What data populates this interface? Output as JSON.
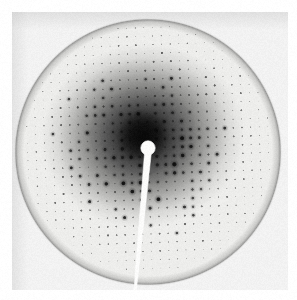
{
  "image": {
    "title": "X-ray diffraction pattern",
    "subject": "single-crystal still diffraction photograph",
    "width": 297,
    "height": 300,
    "background_color": "#ffffff"
  },
  "film": {
    "label": "detector-film-plate",
    "x": 12,
    "y": 12,
    "width": 276,
    "height": 278,
    "base_color": "#f2f2f2",
    "edge_shadow_color": "#e3e3e3",
    "grain_opacity": 0.05
  },
  "diffraction_disc": {
    "label": "diffraction-disc",
    "center_x": 148,
    "center_y": 152,
    "radius": 131,
    "interior_color": "#ededeb",
    "edge_ring_color": "#9a9a98",
    "edge_ring_width": 2.2
  },
  "central_halo": {
    "label": "direct-beam-halo",
    "center_x": 143,
    "center_y": 136,
    "inner_radius": 6,
    "outer_radius": 96,
    "core_color": "#0d0d0d",
    "mid_color": "#6b6b6b",
    "falloff_exponent": 1.55
  },
  "beamstop": {
    "label": "beamstop-shadow",
    "disc_center_x": 148,
    "disc_center_y": 148,
    "disc_radius": 7.2,
    "color": "#fbfbfa",
    "arm_top_x": 148,
    "arm_top_y": 152,
    "arm_top_half_width": 3.4,
    "arm_bottom_x": 135,
    "arm_bottom_y": 292,
    "arm_bottom_half_width": 1.1
  },
  "lattice": {
    "label": "reciprocal-lattice-spots",
    "spacing_x": 8.6,
    "spacing_y": 8.6,
    "rotation_degrees": -2.0,
    "origin_x": 148,
    "origin_y": 148,
    "index_range": 18,
    "spot_color": "#101010",
    "max_spot_radius": 2.5,
    "min_spot_radius": 0.55,
    "intensity_seed": 20250117,
    "systematic_absence_note": "alternating weak/strong rows give checkerboard intensity modulation"
  },
  "rendering": {
    "vignette_opacity": 0.06,
    "noise_amount": 7
  },
  "annotations": {
    "caption": "Single-crystal X-ray diffraction still photograph showing a circular detector disc, a dense reciprocal-lattice spot array, a dark direct-beam halo and a white beamstop with supporting arm."
  }
}
